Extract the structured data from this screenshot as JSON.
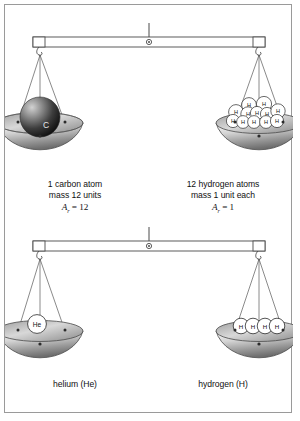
{
  "figure": {
    "background_color": "#ffffff",
    "border_color": "#9a9a9a"
  },
  "balances": [
    {
      "id": "top-balance",
      "beam": {
        "pivot_icon": "pivot-circle-icon",
        "rod_icon": "support-rod-icon"
      },
      "left_pan": {
        "id": "carbon-pan",
        "contents_icon": "carbon-atom-sphere-icon",
        "atom_symbol": "C",
        "atom_count": 1,
        "caption": {
          "line1": "1 carbon atom",
          "line2": "mass 12 units",
          "line3_symbol": "A",
          "line3_subscript": "r",
          "line3_value": "= 12"
        }
      },
      "right_pan": {
        "id": "hydrogen-pan-twelve",
        "contents_icon": "hydrogen-atom-cluster-icon",
        "atom_symbol": "H",
        "atom_count": 12,
        "caption": {
          "line1": "12 hydrogen atoms",
          "line2": "mass 1 unit each",
          "line3_symbol": "A",
          "line3_subscript": "r",
          "line3_value": "= 1"
        }
      }
    },
    {
      "id": "bottom-balance",
      "beam": {
        "pivot_icon": "pivot-circle-icon",
        "rod_icon": "support-rod-icon"
      },
      "left_pan": {
        "id": "helium-pan",
        "contents_icon": "helium-atom-icon",
        "atom_symbol": "He",
        "atom_count": 1,
        "caption": {
          "line1": "helium (He)"
        }
      },
      "right_pan": {
        "id": "hydrogen-pan-four",
        "contents_icon": "hydrogen-atom-row-icon",
        "atom_symbol": "H",
        "atom_count": 4,
        "caption": {
          "line1": "hydrogen (H)"
        }
      }
    }
  ],
  "colors": {
    "outline": "#4a4a4a",
    "beam_fill": "#ffffff",
    "pan_light": "#f2f2f2",
    "pan_mid": "#bfbfbf",
    "pan_dark": "#707070",
    "atom_white": "#ffffff",
    "carbon_light": "#b9b9b9",
    "carbon_dark": "#111111",
    "text": "#111111"
  }
}
